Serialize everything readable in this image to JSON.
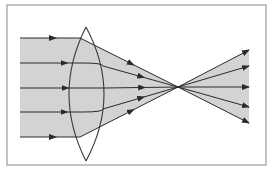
{
  "diagram": {
    "type": "optics-ray-diagram",
    "colors": {
      "background": "#ffffff",
      "frame": "#9a9a9a",
      "beam_fill": "#d3d3d3",
      "ray": "#2a2a2a",
      "lens": "#3a3a3a"
    },
    "frame": {
      "x": 7,
      "y": 5,
      "width": 259,
      "height": 160
    },
    "lens": {
      "center_x": 86,
      "top_y": 27,
      "bottom_y": 161,
      "left_x": 68,
      "right_x": 105
    },
    "focal_point": {
      "x": 178,
      "y": 87
    },
    "incoming_start_x": 20,
    "rays": [
      {
        "y_in": 38,
        "lens_exit": {
          "x": 80,
          "y": 38
        },
        "end": {
          "x": 249,
          "y": 123
        }
      },
      {
        "y_in": 63,
        "lens_exit": {
          "x": 103,
          "y": 66
        },
        "end": {
          "x": 249,
          "y": 107
        }
      },
      {
        "y_in": 88,
        "lens_exit": {
          "x": 105,
          "y": 88
        },
        "end": {
          "x": 249,
          "y": 87
        }
      },
      {
        "y_in": 112,
        "lens_exit": {
          "x": 103,
          "y": 109
        },
        "end": {
          "x": 249,
          "y": 66
        }
      },
      {
        "y_in": 137,
        "lens_exit": {
          "x": 80,
          "y": 137
        },
        "end": {
          "x": 249,
          "y": 50
        }
      }
    ]
  }
}
